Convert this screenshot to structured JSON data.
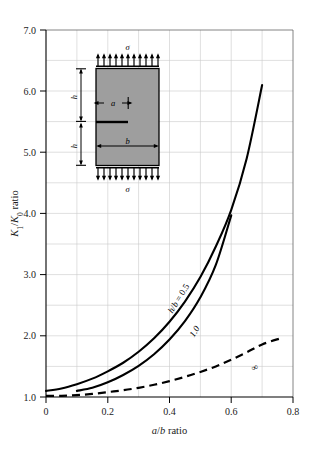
{
  "chart_data": {
    "type": "line",
    "title": "",
    "xlabel": "a/b ratio",
    "ylabel": "K₁/K₀ ratio",
    "xlim": [
      0,
      0.8
    ],
    "ylim": [
      1.0,
      7.0
    ],
    "grid": true,
    "legend_position": "inline-curve-labels",
    "xticks": [
      "0",
      "0.2",
      "0.4",
      "0.6",
      "0.8"
    ],
    "xtick_values": [
      0,
      0.2,
      0.4,
      0.6,
      0.8
    ],
    "yticks": [
      "1.0",
      "2.0",
      "3.0",
      "4.0",
      "5.0",
      "6.0",
      "7.0"
    ],
    "ytick_values": [
      1.0,
      2.0,
      3.0,
      4.0,
      5.0,
      6.0,
      7.0
    ],
    "x_minor_step": 0.1,
    "y_minor_step": 0.5,
    "series": [
      {
        "name": "h/b = 0.5",
        "label": "h/b = 0.5",
        "style": "solid",
        "color": "#000000",
        "x": [
          0.0,
          0.05,
          0.1,
          0.15,
          0.2,
          0.25,
          0.3,
          0.35,
          0.4,
          0.45,
          0.5,
          0.55,
          0.6,
          0.65,
          0.7
        ],
        "y": [
          1.1,
          1.14,
          1.21,
          1.3,
          1.42,
          1.56,
          1.74,
          1.96,
          2.23,
          2.56,
          2.96,
          3.46,
          4.06,
          4.9,
          6.1
        ]
      },
      {
        "name": "1.0",
        "label": "1.0",
        "style": "solid",
        "color": "#000000",
        "x": [
          0.1,
          0.15,
          0.2,
          0.25,
          0.3,
          0.35,
          0.4,
          0.45,
          0.5,
          0.55,
          0.6
        ],
        "y": [
          1.1,
          1.15,
          1.24,
          1.36,
          1.51,
          1.7,
          1.94,
          2.24,
          2.63,
          3.16,
          3.97
        ]
      },
      {
        "name": "∞",
        "label": "∞",
        "style": "dashed",
        "color": "#000000",
        "x": [
          0.0,
          0.05,
          0.1,
          0.15,
          0.2,
          0.25,
          0.3,
          0.35,
          0.4,
          0.45,
          0.5,
          0.55,
          0.6,
          0.65,
          0.7,
          0.76
        ],
        "y": [
          1.02,
          1.02,
          1.03,
          1.05,
          1.08,
          1.11,
          1.15,
          1.2,
          1.26,
          1.33,
          1.41,
          1.5,
          1.61,
          1.73,
          1.86,
          1.96
        ]
      }
    ]
  },
  "inset": {
    "name": "center-cracked-plate-diagram",
    "plate_fill": "#9e9e9e",
    "stress_symbol_top": "σ",
    "stress_symbol_bottom": "σ",
    "dim_height_upper": "h",
    "dim_height_lower": "h",
    "dim_crack": "a",
    "dim_width": "b",
    "arrow_count_top": 11,
    "arrow_count_bottom": 11
  }
}
